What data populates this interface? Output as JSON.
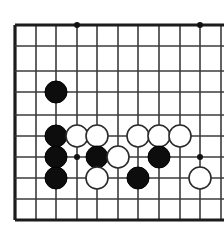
{
  "board": {
    "kind": "go-board",
    "description": "Cropped Go board diagram with black and white stones",
    "background_color": "#ffffff",
    "line_color": "#3b3b3b",
    "edge_line_color": "#1c1c1c",
    "black_stone_color": "#0d0d0d",
    "white_stone_color": "#ffffff",
    "white_stone_border_color": "#2a2a2a",
    "stone_radius": 11,
    "grid_spacing": 20.5,
    "vertical_lines": [
      {
        "x": 15,
        "edge": true
      },
      {
        "x": 36,
        "edge": false
      },
      {
        "x": 56,
        "edge": false
      },
      {
        "x": 77,
        "edge": false
      },
      {
        "x": 97,
        "edge": false
      },
      {
        "x": 118,
        "edge": false
      },
      {
        "x": 138,
        "edge": false
      },
      {
        "x": 159,
        "edge": false
      },
      {
        "x": 180,
        "edge": false
      },
      {
        "x": 200,
        "edge": false
      },
      {
        "x": 221,
        "edge": false
      }
    ],
    "horizontal_lines": [
      {
        "y": 25,
        "edge": true
      },
      {
        "y": 46,
        "edge": false
      },
      {
        "y": 71,
        "edge": false
      },
      {
        "y": 92,
        "edge": false
      },
      {
        "y": 115,
        "edge": false
      },
      {
        "y": 136,
        "edge": false
      },
      {
        "y": 157,
        "edge": false
      },
      {
        "y": 178,
        "edge": false
      },
      {
        "y": 199,
        "edge": false
      },
      {
        "y": 220,
        "edge": true
      }
    ],
    "star_points": [
      {
        "x": 77,
        "y": 25
      },
      {
        "x": 200,
        "y": 25
      },
      {
        "x": 77,
        "y": 157
      },
      {
        "x": 200,
        "y": 157
      }
    ],
    "stones": [
      {
        "color": "black",
        "x": 56,
        "y": 92
      },
      {
        "color": "black",
        "x": 56,
        "y": 136
      },
      {
        "color": "white",
        "x": 77,
        "y": 136
      },
      {
        "color": "white",
        "x": 97,
        "y": 136
      },
      {
        "color": "white",
        "x": 138,
        "y": 136
      },
      {
        "color": "white",
        "x": 159,
        "y": 136
      },
      {
        "color": "white",
        "x": 180,
        "y": 136
      },
      {
        "color": "black",
        "x": 56,
        "y": 157
      },
      {
        "color": "black",
        "x": 97,
        "y": 157
      },
      {
        "color": "white",
        "x": 118,
        "y": 157
      },
      {
        "color": "black",
        "x": 159,
        "y": 157
      },
      {
        "color": "black",
        "x": 56,
        "y": 178
      },
      {
        "color": "white",
        "x": 97,
        "y": 178
      },
      {
        "color": "black",
        "x": 138,
        "y": 178
      },
      {
        "color": "white",
        "x": 200,
        "y": 178
      }
    ]
  }
}
